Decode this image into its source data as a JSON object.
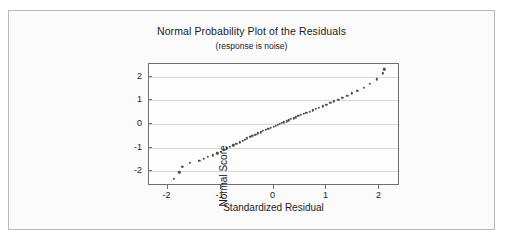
{
  "chart_data": {
    "type": "scatter",
    "title": "Normal Probability Plot of the Residuals",
    "subtitle": "(response is noise)",
    "xlabel": "Standardized Residual",
    "ylabel": "Normal Score",
    "xlim": [
      -2.35,
      2.35
    ],
    "ylim": [
      -2.55,
      2.55
    ],
    "xticks": [
      -2,
      -1,
      0,
      1,
      2
    ],
    "xticklabels": [
      "-2",
      "-1",
      "0",
      "1",
      "2"
    ],
    "yticks": [
      -2,
      -1,
      0,
      1,
      2
    ],
    "yticklabels": [
      "-2",
      "-1",
      "0",
      "1",
      "2"
    ],
    "grid": "horizontal",
    "legend": "none",
    "marker_color": "#4c4c4c",
    "frame_color": "#6e6e6e",
    "gridline_color": "#d8d8d8",
    "points": [
      [
        -1.88,
        -2.32
      ],
      [
        -1.78,
        -2.05
      ],
      [
        -1.72,
        -1.82
      ],
      [
        -1.58,
        -1.66
      ],
      [
        -1.4,
        -1.57
      ],
      [
        -1.32,
        -1.47
      ],
      [
        -1.24,
        -1.4
      ],
      [
        -1.14,
        -1.33
      ],
      [
        -1.06,
        -1.25
      ],
      [
        -1.0,
        -1.18
      ],
      [
        -0.94,
        -1.1
      ],
      [
        -0.88,
        -1.03
      ],
      [
        -0.82,
        -0.97
      ],
      [
        -0.76,
        -0.9
      ],
      [
        -0.7,
        -0.84
      ],
      [
        -0.64,
        -0.78
      ],
      [
        -0.58,
        -0.72
      ],
      [
        -0.54,
        -0.66
      ],
      [
        -0.5,
        -0.6
      ],
      [
        -0.44,
        -0.55
      ],
      [
        -0.4,
        -0.5
      ],
      [
        -0.34,
        -0.45
      ],
      [
        -0.3,
        -0.4
      ],
      [
        -0.24,
        -0.35
      ],
      [
        -0.2,
        -0.3
      ],
      [
        -0.14,
        -0.25
      ],
      [
        -0.1,
        -0.21
      ],
      [
        -0.05,
        -0.17
      ],
      [
        0.0,
        -0.12
      ],
      [
        0.04,
        -0.08
      ],
      [
        0.08,
        -0.04
      ],
      [
        0.12,
        0.0
      ],
      [
        0.16,
        0.04
      ],
      [
        0.2,
        0.08
      ],
      [
        0.25,
        0.12
      ],
      [
        0.29,
        0.16
      ],
      [
        0.33,
        0.21
      ],
      [
        0.38,
        0.25
      ],
      [
        0.42,
        0.29
      ],
      [
        0.47,
        0.34
      ],
      [
        0.52,
        0.38
      ],
      [
        0.57,
        0.43
      ],
      [
        0.62,
        0.48
      ],
      [
        0.68,
        0.53
      ],
      [
        0.74,
        0.58
      ],
      [
        0.8,
        0.64
      ],
      [
        0.86,
        0.7
      ],
      [
        0.93,
        0.76
      ],
      [
        1.0,
        0.82
      ],
      [
        1.07,
        0.89
      ],
      [
        1.14,
        0.96
      ],
      [
        1.22,
        1.04
      ],
      [
        1.3,
        1.12
      ],
      [
        1.39,
        1.21
      ],
      [
        1.48,
        1.31
      ],
      [
        1.58,
        1.42
      ],
      [
        1.7,
        1.55
      ],
      [
        1.82,
        1.7
      ],
      [
        1.95,
        1.9
      ],
      [
        2.06,
        2.15
      ],
      [
        2.09,
        2.32
      ]
    ]
  }
}
